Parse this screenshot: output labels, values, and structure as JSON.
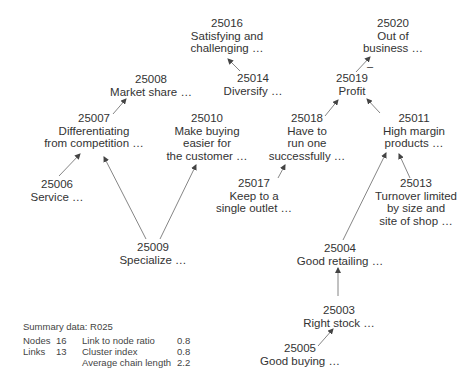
{
  "diagram": {
    "nodes": [
      {
        "id": "25016",
        "label_lines": [
          "Satisfying and",
          "challenging …"
        ],
        "x": 227,
        "y": 18
      },
      {
        "id": "25014",
        "label_lines": [
          "Diversify …"
        ],
        "x": 256,
        "y": 73
      },
      {
        "id": "25008",
        "label_lines": [
          "Market share …"
        ],
        "x": 151,
        "y": 73
      },
      {
        "id": "25007",
        "label_lines": [
          "Differentiating",
          "from competition …"
        ],
        "x": 94,
        "y": 111
      },
      {
        "id": "25010",
        "label_lines": [
          "Make buying",
          "easier for",
          "the customer …"
        ],
        "x": 207,
        "y": 111
      },
      {
        "id": "25006",
        "label_lines": [
          "Service …"
        ],
        "x": 57,
        "y": 176
      },
      {
        "id": "25009",
        "label_lines": [
          "Specialize …"
        ],
        "x": 153,
        "y": 241
      },
      {
        "id": "25020",
        "label_lines": [
          "Out of",
          "business …"
        ],
        "x": 393,
        "y": 18
      },
      {
        "id": "25019",
        "label_lines": [
          "Profit"
        ],
        "x": 371,
        "y": 73
      },
      {
        "id": "25018",
        "label_lines": [
          "Have to",
          "run one",
          "successfully …"
        ],
        "x": 307,
        "y": 111
      },
      {
        "id": "25011",
        "label_lines": [
          "High margin",
          "products …"
        ],
        "x": 414,
        "y": 111
      },
      {
        "id": "25017",
        "label_lines": [
          "Keep to a",
          "single outlet …"
        ],
        "x": 254,
        "y": 176
      },
      {
        "id": "25013",
        "label_lines": [
          "Turnover limited",
          "by size and",
          "site of shop …"
        ],
        "x": 417,
        "y": 176
      },
      {
        "id": "25004",
        "label_lines": [
          "Good retailing …"
        ],
        "x": 339,
        "y": 241
      },
      {
        "id": "25003",
        "label_lines": [
          "Right stock …"
        ],
        "x": 339,
        "y": 303
      },
      {
        "id": "25005",
        "label_lines": [
          "Good buying …"
        ],
        "x": 300,
        "y": 341
      }
    ],
    "edges": [
      {
        "from": "25014",
        "to": "25016",
        "sign": ""
      },
      {
        "from": "25007",
        "to": "25008",
        "sign": ""
      },
      {
        "from": "25006",
        "to": "25007",
        "sign": ""
      },
      {
        "from": "25009",
        "to": "25007",
        "sign": ""
      },
      {
        "from": "25009",
        "to": "25010",
        "sign": ""
      },
      {
        "from": "25019",
        "to": "25020",
        "sign": "–"
      },
      {
        "from": "25018",
        "to": "25019",
        "sign": ""
      },
      {
        "from": "25011",
        "to": "25019",
        "sign": ""
      },
      {
        "from": "25017",
        "to": "25018",
        "sign": ""
      },
      {
        "from": "25013",
        "to": "25011",
        "sign": ""
      },
      {
        "from": "25004",
        "to": "25011",
        "sign": ""
      },
      {
        "from": "25003",
        "to": "25004",
        "sign": ""
      },
      {
        "from": "25005",
        "to": "25003",
        "sign": ""
      }
    ],
    "colors": {
      "text": "#333333",
      "edge": "#555555",
      "background": "#ffffff"
    }
  },
  "summary": {
    "title": "Summary data: R025",
    "rows": [
      {
        "k1": "Nodes",
        "v1": "16",
        "k2": "Link to node ratio",
        "v2": "0.8"
      },
      {
        "k1": "Links",
        "v1": "13",
        "k2": "Cluster index",
        "v2": "0.8"
      },
      {
        "k1": "",
        "v1": "",
        "k2": "Average chain length",
        "v2": "2.2"
      }
    ]
  }
}
